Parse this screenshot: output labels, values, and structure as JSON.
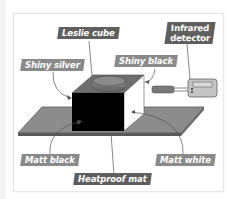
{
  "diagram": {
    "labels": {
      "leslie_cube": "Leslie cube",
      "infrared_detector_line1": "Infrared",
      "infrared_detector_line2": "detector",
      "shiny_silver": "Shiny silver",
      "shiny_black": "Shiny black",
      "matt_black": "Matt black",
      "matt_white": "Matt white",
      "heatproof_mat": "Heatproof mat"
    },
    "colors": {
      "label_dark": "#5f5f5f",
      "label_light": "#8a8a8a",
      "mat": "#8c8c8c",
      "cube_front": "#000000",
      "cube_top": "#6e6e6e",
      "cube_side": "#ffffff",
      "detector_body": "#b8b8b8"
    }
  }
}
